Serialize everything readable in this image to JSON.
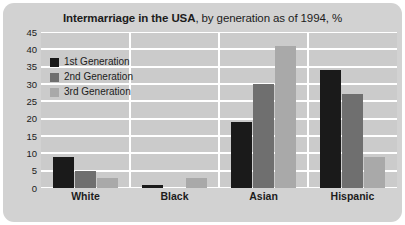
{
  "title": {
    "strong": "Intermarriage in the USA",
    "light": ", by generation as of 1994, %"
  },
  "colors": {
    "panel_background": "#d2d2d2",
    "plot_background": "#cbcbcb",
    "gridline": "#ffffff",
    "generation_1": "#1a1a1a",
    "generation_2": "#6f6f6f",
    "generation_3": "#a9a9a9",
    "text": "#1c1c1c"
  },
  "legend": {
    "items": [
      {
        "label": "1st Generation",
        "color": "#1a1a1a"
      },
      {
        "label": "2nd Generation",
        "color": "#6f6f6f"
      },
      {
        "label": "3rd Generation",
        "color": "#a9a9a9"
      }
    ]
  },
  "chart_data": {
    "type": "bar",
    "title": "Intermarriage in the USA, by generation as of 1994, %",
    "xlabel": "",
    "ylabel": "",
    "categories": [
      "White",
      "Black",
      "Asian",
      "Hispanic"
    ],
    "series": [
      {
        "name": "1st Generation",
        "color": "#1a1a1a",
        "values": [
          9,
          1,
          19,
          34
        ]
      },
      {
        "name": "2nd Generation",
        "color": "#6f6f6f",
        "values": [
          5,
          0,
          30,
          27
        ]
      },
      {
        "name": "3rd Generation",
        "color": "#a9a9a9",
        "values": [
          3,
          3,
          41,
          9
        ]
      }
    ],
    "ylim": [
      0,
      45
    ],
    "yticks": [
      0,
      5,
      10,
      15,
      20,
      25,
      30,
      35,
      40,
      45
    ],
    "ytick_labels": [
      "0",
      "5",
      "10",
      "15",
      "20",
      "25",
      "30",
      "35",
      "40",
      "45"
    ],
    "grid": true,
    "legend_position": "upper-left-inside"
  }
}
